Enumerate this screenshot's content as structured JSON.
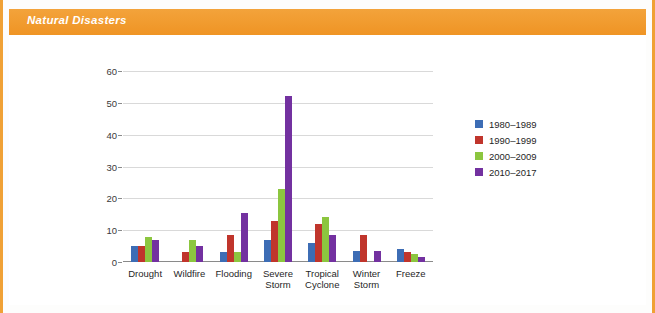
{
  "header": {
    "title": "Natural Disasters",
    "bar_color": "#f0982a",
    "title_color": "#ffffff"
  },
  "frame": {
    "rail_color": "#f0a135",
    "panel_background": "#ffffff"
  },
  "legend": {
    "position": "right",
    "items": [
      {
        "label": "1980–1989",
        "color": "#3d6db5",
        "swatch_name": "legend-swatch-1980-1989"
      },
      {
        "label": "1990–1999",
        "color": "#c0352c",
        "swatch_name": "legend-swatch-1990-1999"
      },
      {
        "label": "2000–2009",
        "color": "#8cc63f",
        "swatch_name": "legend-swatch-2000-2009"
      },
      {
        "label": "2010–2017",
        "color": "#7331a0",
        "swatch_name": "legend-swatch-2010-2017"
      }
    ]
  },
  "yaxis": {
    "ticks": [
      "0",
      "10",
      "20",
      "30",
      "40",
      "50",
      "60"
    ],
    "tick_values": [
      0,
      10,
      20,
      30,
      40,
      50,
      60
    ],
    "min": 0,
    "max": 60
  },
  "chart_data": {
    "type": "bar",
    "title": "Natural Disasters",
    "subtitle": "",
    "xlabel": "",
    "ylabel": "",
    "ylim": [
      0,
      60
    ],
    "grid": true,
    "legend_position": "right",
    "categories": [
      "Drought",
      "Wildfire",
      "Flooding",
      "Severe\nStorm",
      "Tropical\nCyclone",
      "Winter\nStorm",
      "Freeze"
    ],
    "series": [
      {
        "name": "1980–1989",
        "color": "#3d6db5",
        "values": [
          5,
          0,
          3,
          7,
          6,
          3.5,
          4
        ]
      },
      {
        "name": "1990–1999",
        "color": "#c0352c",
        "values": [
          5,
          3,
          8.5,
          13,
          12,
          8.5,
          3
        ]
      },
      {
        "name": "2000–2009",
        "color": "#8cc63f",
        "values": [
          8,
          7,
          3,
          23,
          14,
          0,
          2.5
        ]
      },
      {
        "name": "2010–2017",
        "color": "#7331a0",
        "values": [
          7,
          5,
          15.5,
          52,
          8.5,
          3.5,
          1.5
        ]
      }
    ]
  }
}
